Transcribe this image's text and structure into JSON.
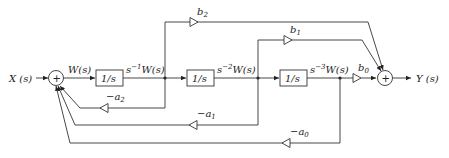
{
  "diagram": {
    "title": "",
    "input_label": "X (s)",
    "output_label": "Y (s)",
    "sum_symbol": "+",
    "signals": {
      "w": "W(s)",
      "s1w": "s⁻¹W(s)",
      "s2w": "s⁻²W(s)",
      "s3w": "s⁻³W(s)"
    },
    "blocks": [
      {
        "id": "int1",
        "label": "1/s"
      },
      {
        "id": "int2",
        "label": "1/s"
      },
      {
        "id": "int3",
        "label": "1/s"
      }
    ],
    "feedforward_gains": [
      {
        "id": "b2",
        "label": "b",
        "sub": "2"
      },
      {
        "id": "b1",
        "label": "b",
        "sub": "1"
      },
      {
        "id": "b0",
        "label": "b",
        "sub": "0"
      }
    ],
    "feedback_gains": [
      {
        "id": "a2",
        "label": "−a",
        "sub": "2"
      },
      {
        "id": "a1",
        "label": "−a",
        "sub": "1"
      },
      {
        "id": "a0",
        "label": "−a",
        "sub": "0"
      }
    ]
  }
}
